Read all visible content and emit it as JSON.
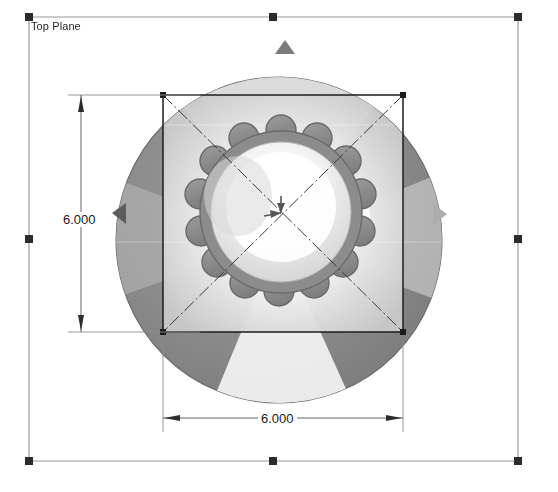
{
  "app": {
    "view_name": "Top View",
    "background_color": "#ffffff"
  },
  "reference_plane": {
    "label": "Top Plane",
    "border_color": "#9a9a9a",
    "handle_color": "#2b2b2b",
    "bounds": {
      "x1": 29,
      "y1": 17,
      "x2": 518,
      "y2": 461
    },
    "handles": [
      {
        "name": "handle-top-left",
        "x": 29,
        "y": 17
      },
      {
        "name": "handle-top-right",
        "x": 518,
        "y": 17
      },
      {
        "name": "handle-bottom-left",
        "x": 29,
        "y": 461
      },
      {
        "name": "handle-bottom-right",
        "x": 518,
        "y": 461
      },
      {
        "name": "handle-mid-left",
        "x": 29,
        "y": 239
      },
      {
        "name": "handle-mid-right",
        "x": 518,
        "y": 239
      },
      {
        "name": "handle-mid-top",
        "x": 273,
        "y": 17
      },
      {
        "name": "handle-mid-bottom",
        "x": 273,
        "y": 461
      }
    ]
  },
  "model": {
    "type": "sphere-with-scalloped-gear",
    "sphere": {
      "center_x": 279,
      "center_y": 240,
      "radius": 163,
      "edge_color": "#6e6e6e",
      "dark_fill": "#7c7c7c",
      "light_fill": "#f2f2f2",
      "highlight_color": "#ffffff"
    },
    "gear": {
      "teeth_count": 14,
      "center_x": 281,
      "center_y": 212,
      "outer_radius": 82,
      "tooth_radius": 14,
      "body_color": "#8e8e8e",
      "outline_color": "#6b6b6b",
      "cap_color": "#e9e9e9"
    },
    "orientation_arrows": [
      {
        "name": "arrow-up-marker",
        "x": 285,
        "y": 47,
        "direction": "up",
        "color": "#7b7b7b"
      },
      {
        "name": "arrow-right-marker",
        "x": 440,
        "y": 214,
        "direction": "right",
        "color": "#a8a8a8"
      },
      {
        "name": "arrow-left-marker",
        "x": 119,
        "y": 213,
        "direction": "left",
        "color": "#5f5f5f"
      }
    ]
  },
  "sketch": {
    "square": {
      "x1": 163,
      "y1": 95,
      "x2": 403,
      "y2": 332,
      "line_color": "#1c1c1c",
      "corner_dot_color": "#1c1c1c"
    },
    "centerlines": {
      "style": "dash-dot",
      "color": "#3a3a3a"
    },
    "center_point": {
      "x": 281,
      "y": 213,
      "color": "#2a2a2a"
    }
  },
  "dimensions": [
    {
      "name": "dimension-vertical",
      "value": "6.000",
      "orientation": "vertical",
      "line_x": 81,
      "y_start": 95,
      "y_end": 332,
      "ext_color": "#6d6d6d",
      "line_color": "#4a4a4a"
    },
    {
      "name": "dimension-horizontal",
      "value": "6.000",
      "orientation": "horizontal",
      "line_y": 418,
      "x_start": 163,
      "x_end": 403,
      "ext_color": "#6d6d6d",
      "line_color": "#4a4a4a"
    }
  ]
}
